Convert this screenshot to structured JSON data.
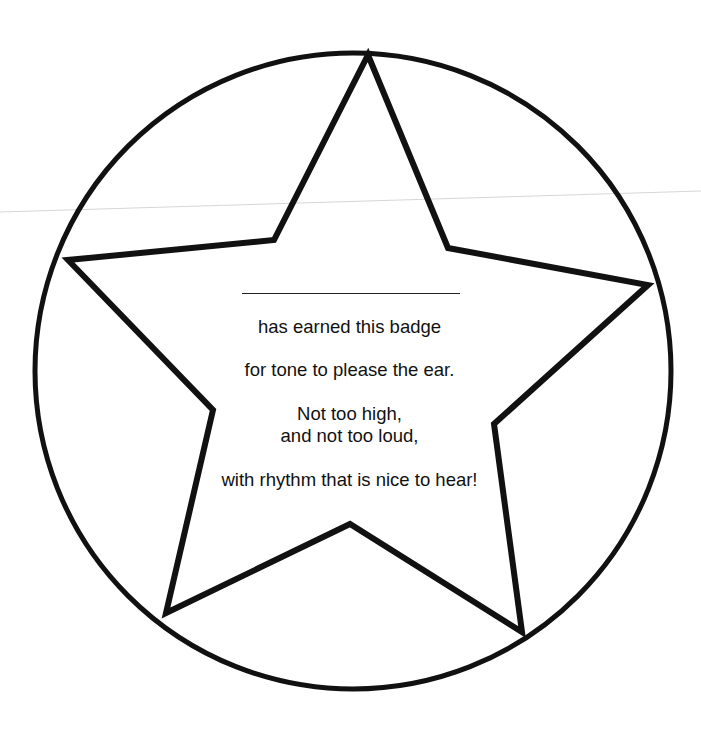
{
  "badge": {
    "name_blank": "",
    "lines": [
      "has earned this badge",
      "for tone to please the ear.",
      "Not too high,",
      "and not too loud,",
      "with rhythm that is nice to hear!"
    ]
  },
  "colors": {
    "ink": "#111111",
    "paper": "#ffffff",
    "fold_line": "#d6d6d6"
  }
}
